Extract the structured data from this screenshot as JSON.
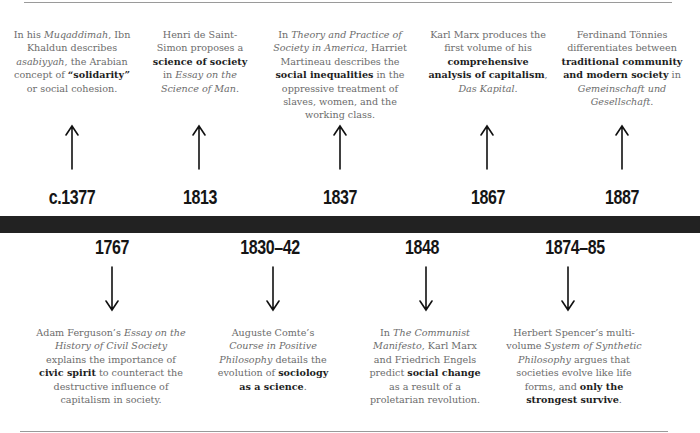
{
  "timeline": {
    "colors": {
      "bar": "#222222",
      "text": "#6c6c6c",
      "emphasis": "#1e1e1e",
      "year": "#151515",
      "rule": "#9a9a9a"
    },
    "top_events": [
      {
        "year": "c.1377",
        "description": [
          {
            "t": "In his "
          },
          {
            "t": "Muqaddimah",
            "s": "i"
          },
          {
            "t": ", Ibn Khaldun describes "
          },
          {
            "t": "asabiyyah",
            "s": "i"
          },
          {
            "t": ", the Arabian concept of "
          },
          {
            "t": "“solidarity”",
            "s": "b"
          },
          {
            "t": " or social cohesion."
          }
        ],
        "arrow": "up-arrow"
      },
      {
        "year": "1813",
        "description": [
          {
            "t": "Henri de Saint-Simon proposes a "
          },
          {
            "t": "science of society",
            "s": "b"
          },
          {
            "t": " in "
          },
          {
            "t": "Essay on the Science of Man",
            "s": "i"
          },
          {
            "t": "."
          }
        ],
        "arrow": "up-arrow"
      },
      {
        "year": "1837",
        "description": [
          {
            "t": "In "
          },
          {
            "t": "Theory and Practice of Society in America",
            "s": "i"
          },
          {
            "t": ", Harriet Martineau describes the "
          },
          {
            "t": "social inequalities",
            "s": "b"
          },
          {
            "t": " in the oppressive treatment of slaves, women, and the working class."
          }
        ],
        "arrow": "up-arrow"
      },
      {
        "year": "1867",
        "description": [
          {
            "t": "Karl Marx produces the first volume of his "
          },
          {
            "t": "comprehensive analysis of capitalism",
            "s": "b"
          },
          {
            "t": ", "
          },
          {
            "t": "Das Kapital",
            "s": "i"
          },
          {
            "t": "."
          }
        ],
        "arrow": "up-arrow"
      },
      {
        "year": "1887",
        "description": [
          {
            "t": "Ferdinand Tönnies differentiates between "
          },
          {
            "t": "traditional community and modern society",
            "s": "b"
          },
          {
            "t": " in "
          },
          {
            "t": "Gemeinschaft und Gesellschaft",
            "s": "i"
          },
          {
            "t": "."
          }
        ],
        "arrow": "up-arrow"
      }
    ],
    "bottom_events": [
      {
        "year": "1767",
        "description": [
          {
            "t": "Adam Ferguson’s "
          },
          {
            "t": "Essay on the History of Civil Society",
            "s": "i"
          },
          {
            "t": " explains the importance of "
          },
          {
            "t": "civic spirit",
            "s": "b"
          },
          {
            "t": " to counteract the destructive influence of capitalism in society."
          }
        ],
        "arrow": "down-arrow"
      },
      {
        "year": "1830–42",
        "description": [
          {
            "t": "Auguste Comte’s "
          },
          {
            "t": "Course in Positive Philosophy",
            "s": "i"
          },
          {
            "t": " details the evolution of "
          },
          {
            "t": "sociology as a science",
            "s": "b"
          },
          {
            "t": "."
          }
        ],
        "arrow": "down-arrow"
      },
      {
        "year": "1848",
        "description": [
          {
            "t": "In "
          },
          {
            "t": "The Communist Manifesto",
            "s": "i"
          },
          {
            "t": ", Karl Marx and Friedrich Engels predict "
          },
          {
            "t": "social change",
            "s": "b"
          },
          {
            "t": " as a result of a proletarian revolution."
          }
        ],
        "arrow": "down-arrow"
      },
      {
        "year": "1874–85",
        "description": [
          {
            "t": "Herbert Spencer’s multi-volume "
          },
          {
            "t": "System of Synthetic Philosophy",
            "s": "i"
          },
          {
            "t": " argues that societies evolve like life forms, and "
          },
          {
            "t": "only the strongest survive",
            "s": "b"
          },
          {
            "t": "."
          }
        ],
        "arrow": "down-arrow"
      }
    ]
  }
}
